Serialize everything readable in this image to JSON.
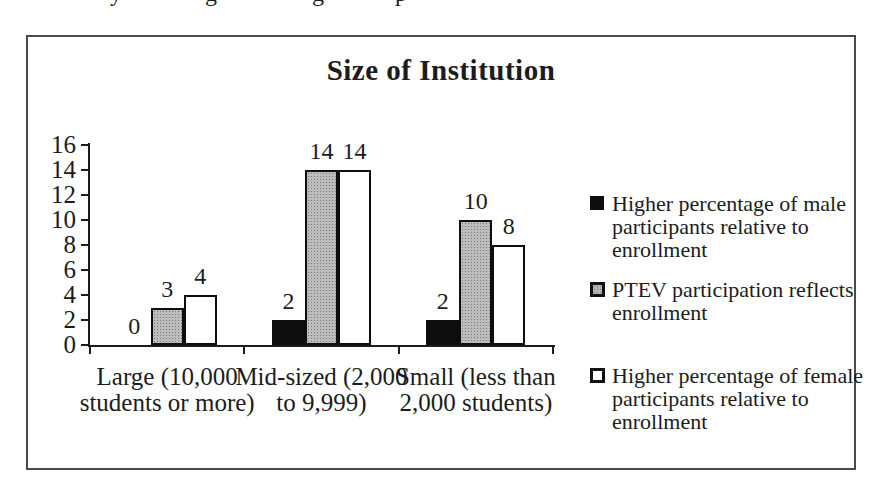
{
  "page": {
    "background": "#ffffff"
  },
  "cropped_top_text": {
    "note": "partially visible line of body text cut off at top edge of screenshot",
    "fragments": [
      {
        "char": "y",
        "x": 110
      },
      {
        "char": "g",
        "x": 205
      },
      {
        "char": "g",
        "x": 312
      },
      {
        "char": "p",
        "x": 395
      }
    ]
  },
  "chart_data": {
    "type": "bar",
    "title": "Size of Institution",
    "categories": [
      "Large (10,000 students or more)",
      "Mid-sized (2,000 to 9,999)",
      "Small (less than 2,000 students)"
    ],
    "series": [
      {
        "name": "Higher percentage of male participants relative to enrollment",
        "fill": "#000000",
        "pattern": "solid",
        "values": [
          0,
          2,
          2
        ]
      },
      {
        "name": "PTEV participation reflects enrollment",
        "fill": "#b5b5b5",
        "pattern": "stipple",
        "values": [
          3,
          14,
          10
        ]
      },
      {
        "name": "Higher percentage of female participants relative to enrollment",
        "fill": "#ffffff",
        "pattern": "solid",
        "values": [
          4,
          14,
          8
        ]
      }
    ],
    "xlabel": "",
    "ylabel": "",
    "ylim": [
      0,
      16
    ],
    "yticks": [
      0,
      2,
      4,
      6,
      8,
      10,
      12,
      14,
      16
    ],
    "bar_labels_shown": true,
    "grid": false,
    "legend_position": "right",
    "axis_color": "#1c1c1c"
  },
  "x_axis": {
    "category_lines": [
      [
        "Large (10,000",
        "students or more)"
      ],
      [
        "Mid-sized (2,000",
        "to 9,999)"
      ],
      [
        "Small (less than",
        "2,000 students)"
      ]
    ]
  },
  "legend": {
    "items": [
      {
        "marker": "black-square",
        "lines": [
          "Higher percentage of male",
          "participants relative to",
          "enrollment"
        ]
      },
      {
        "marker": "gray-square",
        "lines": [
          "PTEV participation reflects",
          "enrollment"
        ]
      },
      {
        "marker": "white-square",
        "lines": [
          "Higher percentage of female",
          "participants relative to",
          "enrollment"
        ]
      }
    ]
  }
}
